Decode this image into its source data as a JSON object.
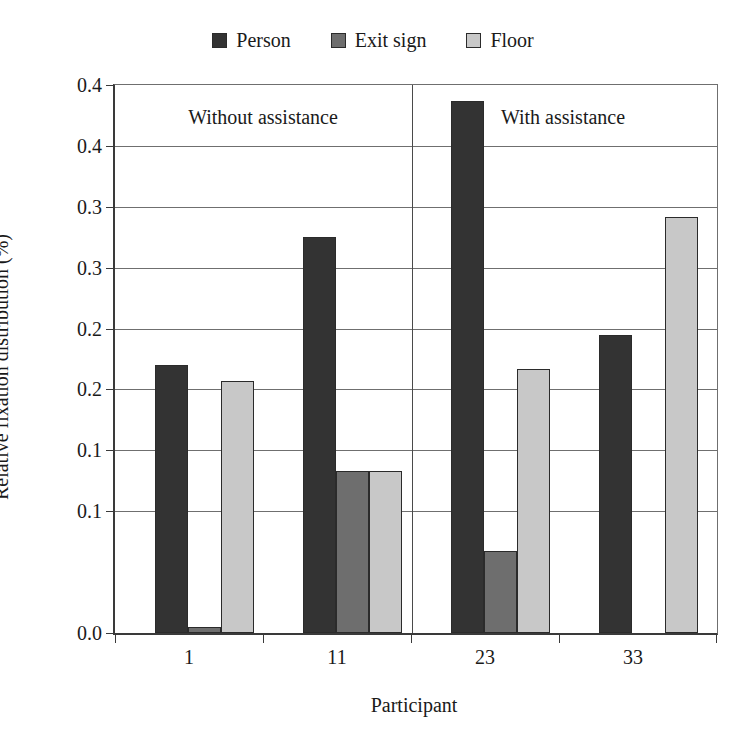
{
  "chart_data": {
    "type": "bar",
    "title": "",
    "xlabel": "Participant",
    "ylabel": "Relative fixation distribution (%)",
    "categories": [
      "1",
      "11",
      "23",
      "33"
    ],
    "series": [
      {
        "name": "Person",
        "color": "#333333",
        "values": [
          0.22,
          0.325,
          0.437,
          0.245
        ]
      },
      {
        "name": "Exit sign",
        "color": "#6e6e6e",
        "values": [
          0.005,
          0.133,
          0.067,
          0.0
        ]
      },
      {
        "name": "Floor",
        "color": "#c8c8c8",
        "values": [
          0.207,
          0.133,
          0.217,
          0.342
        ]
      }
    ],
    "ylim": [
      0.0,
      0.45
    ],
    "ytick_values": [
      0.0,
      0.05,
      0.1,
      0.15,
      0.2,
      0.25,
      0.3,
      0.35,
      0.4,
      0.45
    ],
    "ytick_labels": [
      "0.0",
      "0.1",
      "0.1",
      "0.2",
      "0.2",
      "0.3",
      "0.3",
      "0.4",
      "0.4"
    ],
    "grid": true,
    "legend_position": "top-center",
    "annotations": [
      {
        "text": "Without assistance",
        "panel": "left"
      },
      {
        "text": "With assistance",
        "panel": "right"
      }
    ]
  },
  "legend": {
    "entries": [
      {
        "label": "Person"
      },
      {
        "label": "Exit sign"
      },
      {
        "label": "Floor"
      }
    ]
  },
  "axes": {
    "y_title": "Relative fixation distribution (%)",
    "x_title": "Participant",
    "y_labels": [
      "0.4",
      "0.4",
      "0.3",
      "0.3",
      "0.2",
      "0.2",
      "0.1",
      "0.1",
      "0.0"
    ],
    "x_labels": [
      "1",
      "11",
      "23",
      "33"
    ]
  },
  "panels": {
    "left_label": "Without assistance",
    "right_label": "With assistance"
  }
}
